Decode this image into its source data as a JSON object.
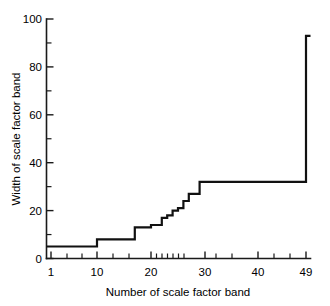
{
  "chart_data": {
    "type": "line",
    "subtype": "step-post",
    "title": "",
    "xlabel": "Number of scale factor band",
    "ylabel": "Width of scale factor band",
    "xlim": [
      1,
      49
    ],
    "ylim": [
      0,
      100
    ],
    "grid": false,
    "legend": null,
    "x_tick_labels": [
      "1",
      "10",
      "20",
      "30",
      "40",
      "49"
    ],
    "x_tick_values": [
      1,
      10,
      20,
      30,
      40,
      49
    ],
    "x_minor_tick_values": [
      4,
      7,
      13,
      16,
      19,
      21,
      22,
      23,
      24,
      25,
      26,
      28,
      32,
      35,
      38,
      43,
      46
    ],
    "y_tick_labels": [
      "0",
      "20",
      "40",
      "60",
      "80",
      "100"
    ],
    "y_tick_values": [
      0,
      20,
      40,
      60,
      80,
      100
    ],
    "y_minor_tick_values": [
      10,
      30,
      50,
      70,
      90
    ],
    "x": [
      1,
      10,
      17,
      20,
      22,
      23,
      24,
      25,
      26,
      27,
      29,
      48,
      49
    ],
    "values": [
      5,
      8,
      13,
      14,
      17,
      18,
      20,
      21,
      24,
      27,
      32,
      32,
      93
    ],
    "series": [
      {
        "name": "Width of scale factor band",
        "points": [
          {
            "x": 1,
            "y": 5
          },
          {
            "x": 10,
            "y": 8
          },
          {
            "x": 17,
            "y": 13
          },
          {
            "x": 20,
            "y": 14
          },
          {
            "x": 22,
            "y": 17
          },
          {
            "x": 23,
            "y": 18
          },
          {
            "x": 24,
            "y": 20
          },
          {
            "x": 25,
            "y": 21
          },
          {
            "x": 26,
            "y": 24
          },
          {
            "x": 27,
            "y": 27
          },
          {
            "x": 29,
            "y": 32
          },
          {
            "x": 48,
            "y": 32
          },
          {
            "x": 49,
            "y": 93
          }
        ]
      }
    ],
    "annotations": [],
    "line_color": "#111111"
  },
  "axes": {
    "y_label": "Width of scale factor band",
    "x_label": "Number of scale factor band",
    "y_ticks": [
      {
        "label": "100",
        "value": 100
      },
      {
        "label": "80",
        "value": 80
      },
      {
        "label": "60",
        "value": 60
      },
      {
        "label": "40",
        "value": 40
      },
      {
        "label": "20",
        "value": 20
      },
      {
        "label": "0",
        "value": 0
      }
    ],
    "x_ticks": [
      {
        "label": "1",
        "value": 1
      },
      {
        "label": "10",
        "value": 10
      },
      {
        "label": "20",
        "value": 20
      },
      {
        "label": "30",
        "value": 30
      },
      {
        "label": "40",
        "value": 40
      },
      {
        "label": "49",
        "value": 49
      }
    ]
  }
}
